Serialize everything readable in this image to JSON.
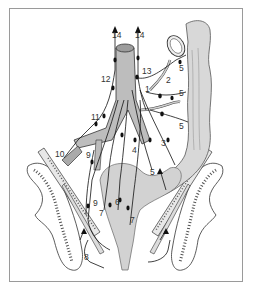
{
  "figure": {
    "type": "anatomical-illustration",
    "colors": {
      "tissue_fill": "#d4d4d4",
      "vessel_fill": "#b8b8b8",
      "line": "#1a1a1a",
      "bone_fill": "#ffffff",
      "frame": "#9a9a9a"
    }
  },
  "labels": [
    {
      "id": "l14a",
      "text": "14",
      "x": 112,
      "y": 38
    },
    {
      "id": "l14b",
      "text": "14",
      "x": 135,
      "y": 38
    },
    {
      "id": "l12",
      "text": "12",
      "x": 101,
      "y": 82
    },
    {
      "id": "l13",
      "text": "13",
      "x": 142,
      "y": 74
    },
    {
      "id": "l1",
      "text": "1",
      "x": 145,
      "y": 92
    },
    {
      "id": "l2",
      "text": "2",
      "x": 166,
      "y": 83
    },
    {
      "id": "l5a",
      "text": "5",
      "x": 179,
      "y": 71
    },
    {
      "id": "l5b",
      "text": "5",
      "x": 179,
      "y": 96
    },
    {
      "id": "l5c",
      "text": "5",
      "x": 179,
      "y": 129
    },
    {
      "id": "l5d",
      "text": "5",
      "x": 150,
      "y": 175
    },
    {
      "id": "l11",
      "text": "11",
      "x": 91,
      "y": 120
    },
    {
      "id": "l3",
      "text": "3",
      "x": 161,
      "y": 146
    },
    {
      "id": "l4",
      "text": "4",
      "x": 132,
      "y": 153
    },
    {
      "id": "l10",
      "text": "10",
      "x": 55,
      "y": 157
    },
    {
      "id": "l9a",
      "text": "9",
      "x": 86,
      "y": 158
    },
    {
      "id": "l9b",
      "text": "9",
      "x": 93,
      "y": 206
    },
    {
      "id": "l6",
      "text": "6",
      "x": 115,
      "y": 205
    },
    {
      "id": "l7a",
      "text": "7",
      "x": 99,
      "y": 216
    },
    {
      "id": "l7b",
      "text": "7",
      "x": 130,
      "y": 223
    },
    {
      "id": "l8",
      "text": "8",
      "x": 84,
      "y": 260
    }
  ]
}
